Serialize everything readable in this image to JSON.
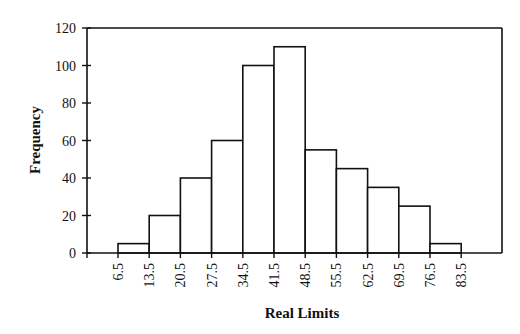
{
  "chart_data": {
    "type": "bar",
    "subtype": "histogram",
    "title": "",
    "xlabel": "Real Limits",
    "ylabel": "Frequency",
    "ylim": [
      0,
      120
    ],
    "yticks": [
      0,
      20,
      40,
      60,
      80,
      100,
      120
    ],
    "xticks": [
      "6.5",
      "13.5",
      "20.5",
      "27.5",
      "34.5",
      "41.5",
      "48.5",
      "55.5",
      "62.5",
      "69.5",
      "76.5",
      "83.5"
    ],
    "bins": [
      {
        "from": 6.5,
        "to": 13.5,
        "value": 5
      },
      {
        "from": 13.5,
        "to": 20.5,
        "value": 20
      },
      {
        "from": 20.5,
        "to": 27.5,
        "value": 40
      },
      {
        "from": 27.5,
        "to": 34.5,
        "value": 60
      },
      {
        "from": 34.5,
        "to": 41.5,
        "value": 100
      },
      {
        "from": 41.5,
        "to": 48.5,
        "value": 110
      },
      {
        "from": 48.5,
        "to": 55.5,
        "value": 55
      },
      {
        "from": 55.5,
        "to": 62.5,
        "value": 45
      },
      {
        "from": 62.5,
        "to": 69.5,
        "value": 35
      },
      {
        "from": 69.5,
        "to": 76.5,
        "value": 25
      },
      {
        "from": 76.5,
        "to": 83.5,
        "value": 5
      }
    ],
    "categories": [
      "6.5-13.5",
      "13.5-20.5",
      "20.5-27.5",
      "27.5-34.5",
      "34.5-41.5",
      "41.5-48.5",
      "48.5-55.5",
      "55.5-62.5",
      "62.5-69.5",
      "69.5-76.5",
      "76.5-83.5"
    ],
    "values": [
      5,
      20,
      40,
      60,
      100,
      110,
      55,
      45,
      35,
      25,
      5
    ],
    "grid": false,
    "legend": null,
    "colors": {
      "bar_fill": "#ffffff",
      "bar_stroke": "#111111",
      "axis": "#111111"
    }
  }
}
